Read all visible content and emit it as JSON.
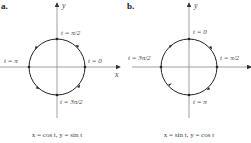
{
  "panels": [
    {
      "id": "a",
      "label": "a.",
      "x_axis": "x",
      "y_axis": "y",
      "points": {
        "top": "t = π/2",
        "left": "t = π",
        "right": "t = 0",
        "bottom": "t = 3π/2"
      },
      "direction": "counterclockwise",
      "caption": "x = cos t, y = sin t"
    },
    {
      "id": "b",
      "label": "b.",
      "x_axis": "x",
      "y_axis": "y",
      "points": {
        "top": "t = 0",
        "left": "t = 3π/2",
        "right": "t = π/2",
        "bottom": "t = π"
      },
      "direction": "clockwise",
      "caption": "x = sin t, y = cos t"
    }
  ],
  "colors": {
    "curve": "#222222",
    "axis": "#888888",
    "text": "#444444"
  }
}
